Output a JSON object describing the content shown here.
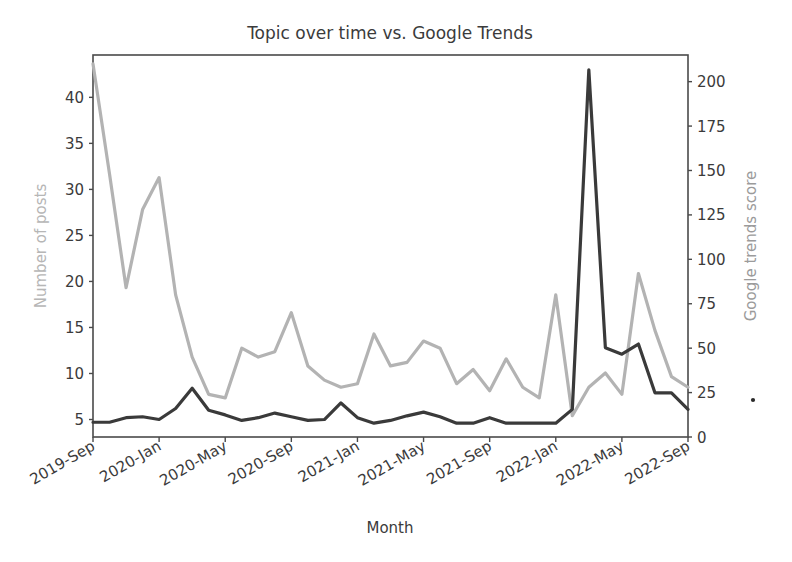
{
  "figure": {
    "width": 792,
    "height": 562,
    "background": "#ffffff"
  },
  "chart_data": {
    "type": "line",
    "title": "Topic over time vs. Google Trends",
    "xlabel": "Month",
    "ylabel": "Number of posts",
    "y2label": "Google trends score",
    "grid": false,
    "legend": "none",
    "x": [
      "2019-Sep",
      "2019-Oct",
      "2019-Nov",
      "2019-Dec",
      "2020-Jan",
      "2020-Feb",
      "2020-Mar",
      "2020-Apr",
      "2020-May",
      "2020-Jun",
      "2020-Jul",
      "2020-Aug",
      "2020-Sep",
      "2020-Oct",
      "2020-Nov",
      "2020-Dec",
      "2021-Jan",
      "2021-Feb",
      "2021-Mar",
      "2021-Apr",
      "2021-May",
      "2021-Jun",
      "2021-Jul",
      "2021-Aug",
      "2021-Sep",
      "2021-Oct",
      "2021-Nov",
      "2021-Dec",
      "2022-Jan",
      "2022-Feb",
      "2022-Mar",
      "2022-Apr",
      "2022-May",
      "2022-Jun",
      "2022-Jul",
      "2022-Aug",
      "2022-Sep"
    ],
    "xtick_labels": [
      "2019-Sep",
      "2020-Jan",
      "2020-May",
      "2020-Sep",
      "2021-Jan",
      "2021-May",
      "2021-Sep",
      "2022-Jan",
      "2022-May",
      "2022-Sep"
    ],
    "xtick_indices": [
      0,
      4,
      8,
      12,
      16,
      20,
      24,
      28,
      32,
      36
    ],
    "ytick_labels": [
      "5",
      "10",
      "15",
      "20",
      "25",
      "30",
      "35",
      "40"
    ],
    "ytick_values": [
      5,
      10,
      15,
      20,
      25,
      30,
      35,
      40
    ],
    "ylim": [
      3.1,
      44.6
    ],
    "y2tick_labels": [
      "0",
      "25",
      "50",
      "75",
      "100",
      "125",
      "150",
      "175",
      "200"
    ],
    "y2tick_values": [
      0,
      25,
      50,
      75,
      100,
      125,
      150,
      175,
      200
    ],
    "y2lim": [
      0,
      215
    ],
    "series": [
      {
        "name": "Google trends score",
        "axis": "right",
        "color": "#b3b3b3",
        "linewidth": 3.2,
        "values": [
          210,
          148,
          84,
          128,
          146,
          80,
          45,
          24,
          22,
          50,
          45,
          48,
          70,
          40,
          32,
          28,
          30,
          58,
          40,
          42,
          54,
          50,
          30,
          38,
          26,
          44,
          28,
          22,
          80,
          12,
          28,
          36,
          24,
          92,
          60,
          34,
          28
        ]
      },
      {
        "name": "Number of posts",
        "axis": "left",
        "color": "#3a3a3a",
        "linewidth": 3.2,
        "values": [
          4.7,
          4.7,
          5.2,
          5.3,
          5.0,
          6.2,
          8.4,
          6.0,
          5.5,
          4.9,
          5.2,
          5.7,
          5.3,
          4.9,
          5.0,
          6.8,
          5.2,
          4.6,
          4.9,
          5.4,
          5.8,
          5.3,
          4.6,
          4.6,
          5.2,
          4.6,
          4.6,
          4.6,
          4.6,
          6.1,
          43.0,
          12.8,
          12.1,
          13.2,
          7.9,
          7.9,
          6.1
        ]
      }
    ],
    "artifact_speck": {
      "x": 753,
      "y": 400
    }
  },
  "axes_geometry": {
    "left": 93,
    "right": 688,
    "top": 55,
    "bottom": 437
  }
}
